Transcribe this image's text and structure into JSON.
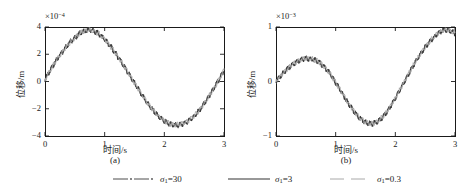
{
  "figure": {
    "caption_a": "(a)",
    "caption_b": "(b)"
  },
  "legend": {
    "items": [
      {
        "label_sigma": "σ",
        "label_sub": "1",
        "label_eq": "=30",
        "style": "dashdot",
        "color": "#4d4d4d"
      },
      {
        "label_sigma": "σ",
        "label_sub": "1",
        "label_eq": "=3",
        "style": "solid",
        "color": "#333333"
      },
      {
        "label_sigma": "σ",
        "label_sub": "1",
        "label_eq": "=0.3",
        "style": "dashed",
        "color": "#a8a8a8"
      }
    ]
  },
  "chart_data": [
    {
      "type": "line",
      "panel": "a",
      "title": "",
      "xlabel": "时间/s",
      "ylabel": "位移/m",
      "y_exponent_prefix": "×10",
      "y_exponent_power": "−4",
      "xlim": [
        0,
        3
      ],
      "ylim": [
        -4,
        4
      ],
      "xticks": [
        0,
        1,
        2,
        3
      ],
      "xtick_labels": [
        "0",
        "1",
        "2",
        "3"
      ],
      "yticks": [
        4,
        2,
        0,
        -2,
        -4
      ],
      "ytick_labels": [
        "4",
        "2",
        "0",
        "−2",
        "−4"
      ],
      "grid": false,
      "legend_position": "below-figure",
      "series": [
        {
          "name": "σ1=30",
          "color": "#4d4d4d",
          "x": [
            0,
            0.05,
            0.1,
            0.15,
            0.2,
            0.25,
            0.3,
            0.35,
            0.4,
            0.45,
            0.5,
            0.55,
            0.6,
            0.65,
            0.7,
            0.75,
            0.8,
            0.85,
            0.9,
            0.95,
            1,
            1.05,
            1.1,
            1.15,
            1.2,
            1.25,
            1.3,
            1.35,
            1.4,
            1.45,
            1.5,
            1.55,
            1.6,
            1.65,
            1.7,
            1.75,
            1.8,
            1.85,
            1.9,
            1.95,
            2,
            2.05,
            2.1,
            2.15,
            2.2,
            2.25,
            2.3,
            2.35,
            2.4,
            2.45,
            2.5,
            2.55,
            2.6,
            2.65,
            2.7,
            2.75,
            2.8,
            2.85,
            2.9,
            2.95,
            3
          ],
          "y": [
            0.15,
            0.55,
            0.95,
            1.3,
            1.65,
            1.95,
            2.25,
            2.55,
            2.8,
            3.05,
            3.25,
            3.45,
            3.6,
            3.7,
            3.78,
            3.8,
            3.75,
            3.66,
            3.52,
            3.35,
            3.12,
            2.88,
            2.6,
            2.3,
            1.98,
            1.65,
            1.3,
            0.95,
            0.6,
            0.25,
            -0.1,
            -0.45,
            -0.8,
            -1.15,
            -1.48,
            -1.78,
            -2.05,
            -2.3,
            -2.55,
            -2.75,
            -2.92,
            -3.05,
            -3.14,
            -3.2,
            -3.22,
            -3.2,
            -3.14,
            -3.05,
            -2.92,
            -2.75,
            -2.55,
            -2.3,
            -2.02,
            -1.72,
            -1.4,
            -1.05,
            -0.7,
            -0.32,
            0.05,
            0.42,
            0.8
          ]
        },
        {
          "name": "σ1=3",
          "color": "#333333",
          "x": [
            0,
            0.1,
            0.2,
            0.3,
            0.4,
            0.5,
            0.6,
            0.7,
            0.8,
            0.9,
            1,
            1.1,
            1.2,
            1.3,
            1.4,
            1.5,
            1.6,
            1.7,
            1.8,
            1.9,
            2,
            2.1,
            2.2,
            2.3,
            2.4,
            2.5,
            2.6,
            2.7,
            2.8,
            2.9,
            3
          ],
          "y": [
            0.1,
            0.9,
            1.6,
            2.2,
            2.75,
            3.2,
            3.55,
            3.75,
            3.72,
            3.5,
            3.1,
            2.55,
            1.95,
            1.28,
            0.58,
            -0.12,
            -0.82,
            -1.48,
            -2.05,
            -2.55,
            -2.9,
            -3.12,
            -3.2,
            -3.12,
            -2.9,
            -2.55,
            -2.05,
            -1.45,
            -0.75,
            0.0,
            0.8
          ]
        },
        {
          "name": "σ1=0.3",
          "color": "#a8a8a8",
          "x": [
            0,
            0.1,
            0.2,
            0.3,
            0.4,
            0.5,
            0.6,
            0.7,
            0.8,
            0.9,
            1,
            1.1,
            1.2,
            1.3,
            1.4,
            1.5,
            1.6,
            1.7,
            1.8,
            1.9,
            2,
            2.1,
            2.2,
            2.3,
            2.4,
            2.5,
            2.6,
            2.7,
            2.8,
            2.9,
            3
          ],
          "y": [
            0.12,
            0.92,
            1.62,
            2.22,
            2.78,
            3.22,
            3.58,
            3.78,
            3.74,
            3.52,
            3.12,
            2.57,
            1.97,
            1.3,
            0.6,
            -0.1,
            -0.8,
            -1.46,
            -2.03,
            -2.53,
            -2.88,
            -3.1,
            -3.18,
            -3.1,
            -2.88,
            -2.53,
            -2.03,
            -1.43,
            -0.73,
            0.02,
            0.82
          ]
        }
      ],
      "noise_amplitude": 0.22,
      "noise_frequency": 26
    },
    {
      "type": "line",
      "panel": "b",
      "title": "",
      "xlabel": "时间/s",
      "ylabel": "位移/m",
      "y_exponent_prefix": "×10",
      "y_exponent_power": "−3",
      "xlim": [
        0,
        3
      ],
      "ylim": [
        -1,
        1
      ],
      "xticks": [
        0,
        1,
        2,
        3
      ],
      "xtick_labels": [
        "0",
        "1",
        "2",
        "3"
      ],
      "yticks": [
        1,
        0,
        -1
      ],
      "ytick_labels": [
        "1",
        "0",
        "−1"
      ],
      "grid": false,
      "legend_position": "below-figure",
      "series": [
        {
          "name": "σ1=30",
          "color": "#4d4d4d",
          "x": [
            0,
            0.05,
            0.1,
            0.15,
            0.2,
            0.25,
            0.3,
            0.35,
            0.4,
            0.45,
            0.5,
            0.55,
            0.6,
            0.65,
            0.7,
            0.75,
            0.8,
            0.85,
            0.9,
            0.95,
            1,
            1.05,
            1.1,
            1.15,
            1.2,
            1.25,
            1.3,
            1.35,
            1.4,
            1.45,
            1.5,
            1.55,
            1.6,
            1.65,
            1.7,
            1.75,
            1.8,
            1.85,
            1.9,
            1.95,
            2,
            2.05,
            2.1,
            2.15,
            2.2,
            2.25,
            2.3,
            2.35,
            2.4,
            2.45,
            2.5,
            2.55,
            2.6,
            2.65,
            2.7,
            2.75,
            2.8,
            2.85,
            2.9,
            2.95,
            3
          ],
          "y": [
            0.0,
            0.07,
            0.13,
            0.19,
            0.24,
            0.29,
            0.33,
            0.36,
            0.39,
            0.41,
            0.42,
            0.42,
            0.41,
            0.4,
            0.37,
            0.33,
            0.28,
            0.22,
            0.15,
            0.07,
            -0.02,
            -0.11,
            -0.2,
            -0.29,
            -0.38,
            -0.46,
            -0.54,
            -0.61,
            -0.67,
            -0.72,
            -0.75,
            -0.77,
            -0.78,
            -0.77,
            -0.74,
            -0.7,
            -0.64,
            -0.57,
            -0.49,
            -0.4,
            -0.31,
            -0.21,
            -0.11,
            -0.01,
            0.09,
            0.19,
            0.29,
            0.38,
            0.47,
            0.55,
            0.63,
            0.7,
            0.76,
            0.82,
            0.87,
            0.91,
            0.94,
            0.95,
            0.94,
            0.92,
            0.88
          ]
        },
        {
          "name": "σ1=3",
          "color": "#333333",
          "x": [
            0,
            0.1,
            0.2,
            0.3,
            0.4,
            0.5,
            0.6,
            0.7,
            0.8,
            0.9,
            1,
            1.1,
            1.2,
            1.3,
            1.4,
            1.5,
            1.6,
            1.7,
            1.8,
            1.9,
            2,
            2.1,
            2.2,
            2.3,
            2.4,
            2.5,
            2.6,
            2.7,
            2.8,
            2.9,
            3
          ],
          "y": [
            0.0,
            0.13,
            0.24,
            0.33,
            0.39,
            0.42,
            0.41,
            0.37,
            0.28,
            0.15,
            -0.02,
            -0.2,
            -0.38,
            -0.54,
            -0.67,
            -0.75,
            -0.78,
            -0.74,
            -0.64,
            -0.49,
            -0.31,
            -0.11,
            0.09,
            0.29,
            0.47,
            0.63,
            0.76,
            0.87,
            0.94,
            0.94,
            0.88
          ]
        },
        {
          "name": "σ1=0.3",
          "color": "#a8a8a8",
          "x": [
            0,
            0.1,
            0.2,
            0.3,
            0.4,
            0.5,
            0.6,
            0.7,
            0.8,
            0.9,
            1,
            1.1,
            1.2,
            1.3,
            1.4,
            1.5,
            1.6,
            1.7,
            1.8,
            1.9,
            2,
            2.1,
            2.2,
            2.3,
            2.4,
            2.5,
            2.6,
            2.7,
            2.8,
            2.9,
            3
          ],
          "y": [
            0.0,
            0.135,
            0.245,
            0.335,
            0.395,
            0.425,
            0.415,
            0.375,
            0.285,
            0.155,
            -0.015,
            -0.195,
            -0.375,
            -0.535,
            -0.665,
            -0.745,
            -0.775,
            -0.735,
            -0.635,
            -0.485,
            -0.305,
            -0.105,
            0.095,
            0.295,
            0.475,
            0.635,
            0.765,
            0.875,
            0.945,
            0.945,
            0.885
          ]
        }
      ],
      "noise_amplitude": 0.055,
      "noise_frequency": 26
    }
  ]
}
